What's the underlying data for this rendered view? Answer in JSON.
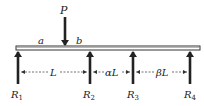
{
  "diagram": {
    "type": "continuous-beam",
    "load": {
      "label": "P",
      "x": 65
    },
    "segments": {
      "a": "a",
      "b": "b"
    },
    "supports": [
      {
        "label": "R",
        "sub": "1",
        "x": 18
      },
      {
        "label": "R",
        "sub": "2",
        "x": 90
      },
      {
        "label": "R",
        "sub": "3",
        "x": 133
      },
      {
        "label": "R",
        "sub": "4",
        "x": 190
      }
    ],
    "spans": [
      {
        "label": "L"
      },
      {
        "label": "αL"
      },
      {
        "label": "βL"
      }
    ]
  }
}
